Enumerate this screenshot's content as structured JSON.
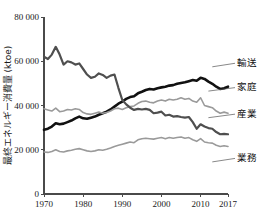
{
  "chart_data": {
    "type": "line",
    "title": "",
    "xlabel": "",
    "ylabel": "最終エネルギー消費量 (ktoe)",
    "xlim": [
      1970,
      2017
    ],
    "ylim": [
      0,
      80000
    ],
    "grid": false,
    "legend_position": "right-inline-labels",
    "x_ticks": [
      "1970",
      "1980",
      "1990",
      "2000",
      "2010",
      "2017"
    ],
    "x_tick_values": [
      1970,
      1980,
      1990,
      2000,
      2010,
      2017
    ],
    "y_ticks": [
      "0",
      "20 000",
      "40 000",
      "60 000",
      "80 000"
    ],
    "y_tick_values": [
      0,
      20000,
      40000,
      60000,
      80000
    ],
    "x": [
      1970,
      1971,
      1972,
      1973,
      1974,
      1975,
      1976,
      1977,
      1978,
      1979,
      1980,
      1981,
      1982,
      1983,
      1984,
      1985,
      1986,
      1987,
      1988,
      1989,
      1990,
      1991,
      1992,
      1993,
      1994,
      1995,
      1996,
      1997,
      1998,
      1999,
      2000,
      2001,
      2002,
      2003,
      2004,
      2005,
      2006,
      2007,
      2008,
      2009,
      2010,
      2011,
      2012,
      2013,
      2014,
      2015,
      2016,
      2017
    ],
    "series": [
      {
        "name": "輸送",
        "label": "輸送",
        "color": "#111111",
        "width": 2.6,
        "label_x": 2013,
        "label_y": 57500,
        "values": [
          29000,
          29500,
          30500,
          32000,
          31500,
          31800,
          32500,
          33200,
          34200,
          35000,
          34200,
          34000,
          34500,
          35000,
          35800,
          36500,
          37200,
          38200,
          39500,
          40800,
          41800,
          43000,
          43800,
          44200,
          45500,
          46200,
          47000,
          47500,
          47200,
          47800,
          48200,
          48500,
          49000,
          49200,
          49800,
          50200,
          50500,
          51000,
          51500,
          51200,
          52500,
          52000,
          50800,
          49800,
          48500,
          47500,
          47800,
          48500
        ]
      },
      {
        "name": "家庭",
        "label": "家庭",
        "color": "#9a9a9a",
        "width": 1.6,
        "label_x": 2012,
        "label_y": 46500,
        "values": [
          38500,
          38000,
          37500,
          38800,
          37200,
          37500,
          38200,
          38000,
          38500,
          38200,
          36800,
          36200,
          36000,
          36500,
          37000,
          36500,
          36800,
          37500,
          38500,
          38800,
          38200,
          39000,
          39500,
          39800,
          41000,
          41800,
          42000,
          41500,
          41200,
          42000,
          42500,
          42000,
          42800,
          42500,
          42800,
          43500,
          42800,
          43200,
          42000,
          41500,
          43500,
          40000,
          39500,
          39000,
          37500,
          36500,
          37000,
          36500
        ]
      },
      {
        "name": "産業",
        "label": "産業",
        "color": "#4f4f4f",
        "width": 2.2,
        "label_x": 2012,
        "label_y": 34500,
        "values": [
          62000,
          61000,
          63000,
          66500,
          63000,
          58500,
          60000,
          59500,
          58500,
          59000,
          56500,
          54000,
          52500,
          53000,
          54500,
          53800,
          52500,
          53500,
          54000,
          48000,
          42500,
          40500,
          39000,
          38000,
          38500,
          38200,
          38500,
          38000,
          36500,
          36800,
          37200,
          35500,
          35800,
          35000,
          35200,
          34800,
          34500,
          34800,
          32500,
          29500,
          31500,
          30500,
          29800,
          29500,
          28000,
          27000,
          27200,
          27000
        ]
      },
      {
        "name": "業務",
        "label": "業務",
        "color": "#9a9a9a",
        "width": 1.6,
        "label_x": 2013,
        "label_y": 14500,
        "values": [
          19000,
          18800,
          19200,
          20000,
          19200,
          19000,
          19500,
          19800,
          20200,
          20500,
          20000,
          19500,
          19200,
          19500,
          20000,
          19800,
          20200,
          20800,
          21500,
          22000,
          22500,
          23000,
          23500,
          23200,
          24500,
          25000,
          25200,
          25000,
          24800,
          25200,
          25500,
          25000,
          25500,
          25200,
          25500,
          25800,
          25200,
          25500,
          24500,
          23800,
          25000,
          23500,
          23200,
          23000,
          22000,
          21500,
          21800,
          21500
        ]
      }
    ]
  },
  "axis": {
    "y_title": "最終エネルギー消費量 (ktoe)",
    "y_title_parts": {
      "japanese": "最終エネルギー消費量",
      "unit": "(ktoe)"
    }
  }
}
